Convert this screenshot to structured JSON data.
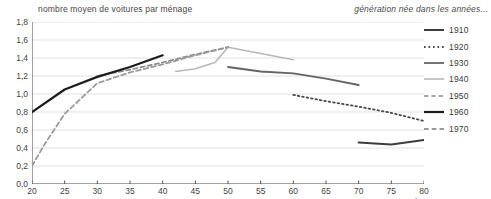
{
  "chart_data": {
    "type": "line",
    "title": "",
    "ylabel": "nombre moyen de voitures par ménage",
    "xlabel": "âge",
    "legend_title": "génération née dans les années...",
    "legend_position": "right",
    "grid": true,
    "xlim": [
      20,
      80
    ],
    "ylim": [
      0.0,
      1.8
    ],
    "yticks": [
      "0,0",
      "0,2",
      "0,4",
      "0,6",
      "0,8",
      "1,0",
      "1,2",
      "1,4",
      "1,6",
      "1,8"
    ],
    "ytick_values": [
      0.0,
      0.2,
      0.4,
      0.6,
      0.8,
      1.0,
      1.2,
      1.4,
      1.6,
      1.8
    ],
    "xticks": [
      "20",
      "25",
      "30",
      "35",
      "40",
      "45",
      "50",
      "55",
      "60",
      "65",
      "70",
      "75",
      "80"
    ],
    "xtick_values": [
      20,
      25,
      30,
      35,
      40,
      45,
      50,
      55,
      60,
      65,
      70,
      75,
      80
    ],
    "series": [
      {
        "name": "1910",
        "style": "solid",
        "color": "#3d3d3d",
        "width": 2.0,
        "x": [
          70,
          75,
          80
        ],
        "values": [
          0.46,
          0.44,
          0.49
        ]
      },
      {
        "name": "1920",
        "style": "dotted",
        "color": "#4a4a4a",
        "width": 1.8,
        "x": [
          60,
          65,
          70,
          75,
          80
        ],
        "values": [
          0.99,
          0.92,
          0.86,
          0.79,
          0.7
        ]
      },
      {
        "name": "1930",
        "style": "solid",
        "color": "#656565",
        "width": 1.8,
        "x": [
          50,
          55,
          60,
          65,
          70
        ],
        "values": [
          1.3,
          1.25,
          1.23,
          1.17,
          1.1
        ]
      },
      {
        "name": "1940",
        "style": "solid",
        "color": "#b8b8b8",
        "width": 1.6,
        "x": [
          42,
          45,
          48,
          50,
          55,
          60
        ],
        "values": [
          1.25,
          1.28,
          1.35,
          1.52,
          1.45,
          1.38
        ]
      },
      {
        "name": "1950",
        "style": "dashed",
        "color": "#8a8a8a",
        "width": 1.7,
        "x": [
          30,
          35,
          40,
          45,
          50
        ],
        "values": [
          1.2,
          1.27,
          1.35,
          1.44,
          1.52
        ]
      },
      {
        "name": "1960",
        "style": "solid",
        "color": "#1c1c1c",
        "width": 2.2,
        "x": [
          20,
          25,
          30,
          35,
          40
        ],
        "values": [
          0.8,
          1.05,
          1.19,
          1.3,
          1.43
        ]
      },
      {
        "name": "1970",
        "style": "dashed",
        "color": "#9a9a9a",
        "width": 1.8,
        "x": [
          20,
          22,
          25,
          30,
          35,
          40,
          45,
          50
        ],
        "values": [
          0.2,
          0.45,
          0.78,
          1.12,
          1.24,
          1.33,
          1.43,
          1.52
        ]
      }
    ]
  },
  "legend": {
    "title": "génération née dans les années...",
    "entries": [
      {
        "label": "1910"
      },
      {
        "label": "1920"
      },
      {
        "label": "1930"
      },
      {
        "label": "1940"
      },
      {
        "label": "1950"
      },
      {
        "label": "1960"
      },
      {
        "label": "1970"
      }
    ]
  },
  "axes": {
    "y_axis_title": "nombre moyen de voitures par ménage",
    "x_axis_title": "âge"
  }
}
